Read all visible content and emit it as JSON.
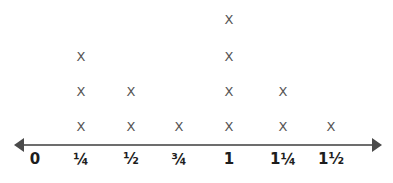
{
  "chart_data": {
    "type": "bar",
    "plot_style": "line-plot-dot-plot",
    "title": "",
    "subtitle": "",
    "xlabel": "",
    "ylabel": "",
    "grid": false,
    "legend": null,
    "mark_glyph": "X",
    "axis": {
      "has_left_arrow": true,
      "has_right_arrow": true,
      "line_color": "#6d6d6d",
      "arrow_color": "#4a4a4a"
    },
    "colors": {
      "mark": "#555555",
      "label": "#1d1d1d",
      "background": "#ffffff"
    },
    "categories": [
      "0",
      "¼",
      "½",
      "¾",
      "1",
      "1¼",
      "1½"
    ],
    "values": [
      0,
      3,
      2,
      1,
      4,
      2,
      1
    ],
    "ylim": [
      0,
      4
    ],
    "columns": [
      {
        "label": "0",
        "x_px": 35,
        "count": 0
      },
      {
        "label": "¼",
        "x_px": 81,
        "count": 3
      },
      {
        "label": "½",
        "x_px": 131,
        "count": 2
      },
      {
        "label": "¾",
        "x_px": 179,
        "count": 1
      },
      {
        "label": "1",
        "x_px": 229,
        "count": 4
      },
      {
        "label": "1¼",
        "x_px": 283,
        "count": 2
      },
      {
        "label": "1½",
        "x_px": 331,
        "count": 1
      }
    ],
    "row_y_px": [
      126,
      91,
      56,
      19
    ]
  }
}
